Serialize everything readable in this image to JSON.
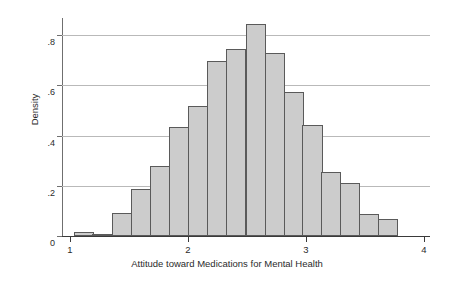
{
  "chart_data": {
    "type": "bar",
    "title": "",
    "subtitle": "",
    "xlabel": "Attitude toward Medications for Mental Health",
    "ylabel": "Density",
    "xlim": [
      1.0,
      4.0
    ],
    "ylim": [
      0,
      0.88
    ],
    "grid": true,
    "legend": null,
    "xticks": [
      1,
      2,
      3,
      4
    ],
    "xtick_labels": [
      "1",
      "2",
      "3",
      "4"
    ],
    "yticks": [
      0,
      0.2,
      0.4,
      0.6,
      0.8
    ],
    "ytick_labels": [
      "0",
      ".2",
      ".4",
      ".6",
      ".8"
    ],
    "bin_width": 0.162,
    "bin_starts": [
      1.03,
      1.19,
      1.36,
      1.52,
      1.68,
      1.84,
      2.0,
      2.16,
      2.32,
      2.49,
      2.65,
      2.81,
      2.97,
      3.13,
      3.29,
      3.45,
      3.61
    ],
    "categories": [
      "1.03",
      "1.19",
      "1.36",
      "1.52",
      "1.68",
      "1.84",
      "2.00",
      "2.16",
      "2.32",
      "2.49",
      "2.65",
      "2.81",
      "2.97",
      "3.13",
      "3.29",
      "3.45",
      "3.61"
    ],
    "values": [
      0.018,
      0.008,
      0.092,
      0.188,
      0.283,
      0.44,
      0.524,
      0.706,
      0.755,
      0.855,
      0.74,
      0.58,
      0.447,
      0.259,
      0.215,
      0.09,
      0.068
    ]
  },
  "axes": {
    "y_label": "Density",
    "x_label": "Attitude toward Medications for Mental Health"
  }
}
